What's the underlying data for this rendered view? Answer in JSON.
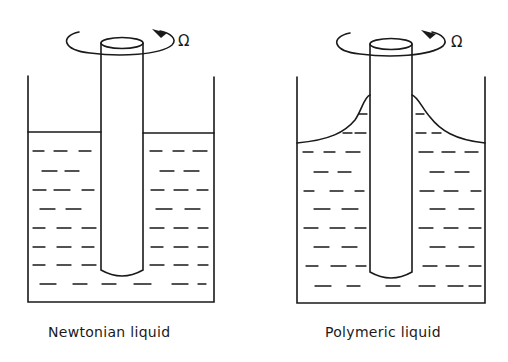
{
  "panels": [
    {
      "id": "newtonian",
      "caption": "Newtonian liquid",
      "rotation_symbol": "Ω",
      "surface_shape": "flat"
    },
    {
      "id": "polymeric",
      "caption": "Polymeric liquid",
      "rotation_symbol": "Ω",
      "surface_shape": "rod-climbing"
    }
  ],
  "colors": {
    "stroke": "#1a1a1a",
    "background": "#ffffff"
  }
}
